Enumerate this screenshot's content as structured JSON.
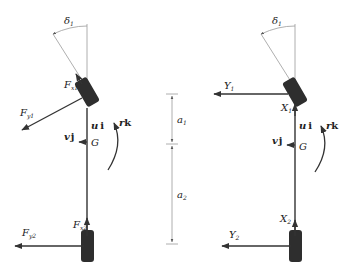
{
  "diagram": {
    "left_panel": {
      "steer_angle": "δ",
      "steer_angle_sub": "1",
      "front_longitudinal_force": "F",
      "front_longitudinal_force_sub": "x1",
      "front_lateral_force": "F",
      "front_lateral_force_sub": "y1",
      "rear_longitudinal_force": "F",
      "rear_longitudinal_force_sub": "x2",
      "rear_lateral_force": "F",
      "rear_lateral_force_sub": "y2",
      "forward_velocity_scalar": "u",
      "forward_velocity_vector": "i",
      "lateral_velocity_scalar": "v",
      "lateral_velocity_vector": "j",
      "center_of_gravity": "G",
      "yaw_rate_scalar": "r",
      "yaw_rate_vector": "k"
    },
    "dimensions": {
      "front_distance": "a",
      "front_distance_sub": "1",
      "rear_distance": "a",
      "rear_distance_sub": "2"
    },
    "right_panel": {
      "steer_angle": "δ",
      "steer_angle_sub": "1",
      "front_lateral_force": "Y",
      "front_lateral_force_sub": "1",
      "front_longitudinal_force": "X",
      "front_longitudinal_force_sub": "1",
      "rear_lateral_force": "Y",
      "rear_lateral_force_sub": "2",
      "rear_longitudinal_force": "X",
      "rear_longitudinal_force_sub": "2",
      "forward_velocity_scalar": "u",
      "forward_velocity_vector": "i",
      "lateral_velocity_scalar": "v",
      "lateral_velocity_vector": "j",
      "center_of_gravity": "G",
      "yaw_rate_scalar": "r",
      "yaw_rate_vector": "k"
    }
  }
}
